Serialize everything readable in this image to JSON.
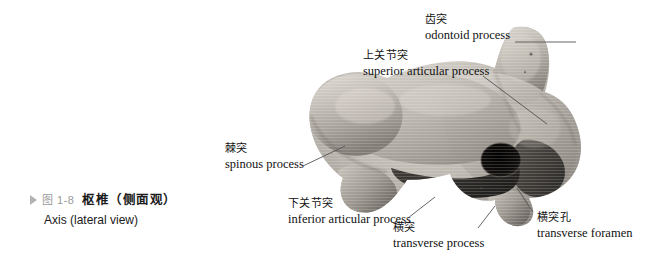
{
  "figure": {
    "bullet_icon": "triangle-right-icon",
    "number": "图 1-8",
    "title_cn": "枢椎（侧面观）",
    "title_en": "Axis (lateral view)"
  },
  "specimen": {
    "name": "axis-vertebra-photograph",
    "view": "lateral",
    "colors": {
      "bone_light": "#cfcbc4",
      "bone_mid": "#a9a49c",
      "bone_dark": "#6d6862",
      "shadow": "#2b2926",
      "foramen": "#141210",
      "background": "#ffffff"
    }
  },
  "annotations": [
    {
      "id": "odontoid-process",
      "cn": "齿突",
      "en": "odontoid process",
      "align": "left"
    },
    {
      "id": "superior-articular-process",
      "cn": "上关节突",
      "en": "superior articular process",
      "align": "left"
    },
    {
      "id": "spinous-process",
      "cn": "棘突",
      "en": "spinous process",
      "align": "left"
    },
    {
      "id": "inferior-articular-process",
      "cn": "下关节突",
      "en": "inferior articular process",
      "align": "left"
    },
    {
      "id": "transverse-process",
      "cn": "横突",
      "en": "transverse process",
      "align": "left"
    },
    {
      "id": "transverse-foramen",
      "cn": "横突孔",
      "en": "transverse foramen",
      "align": "left"
    }
  ],
  "leader_line_color": "#555555"
}
